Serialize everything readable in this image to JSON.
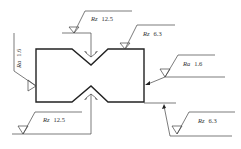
{
  "drawing": {
    "colors": {
      "outline": "#222222",
      "leader": "#444444",
      "background": "#ffffff"
    },
    "symbols": [
      {
        "id": "top-groove",
        "param": "Rz",
        "value": "12.5"
      },
      {
        "id": "top-surface",
        "param": "Rz",
        "value": "6.3"
      },
      {
        "id": "left-surface",
        "param": "Ra",
        "value": "1.6"
      },
      {
        "id": "right-surface",
        "param": "Ra",
        "value": "1.6"
      },
      {
        "id": "bottom-groove",
        "param": "Rz",
        "value": "12.5"
      },
      {
        "id": "bottom-surface",
        "param": "Rz",
        "value": "6.3"
      }
    ]
  }
}
